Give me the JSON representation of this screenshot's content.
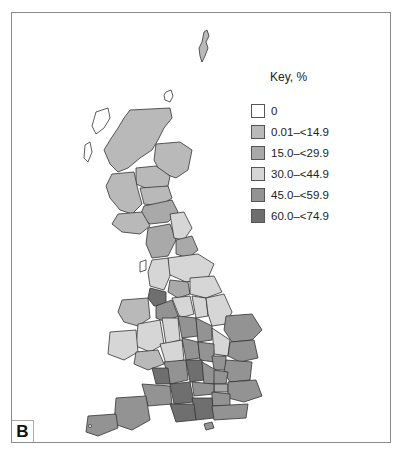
{
  "figure": {
    "panel_label": "B",
    "key_title": "Key, %"
  },
  "key": [
    {
      "label": "0",
      "color": "#ffffff"
    },
    {
      "label": "0.01–<14.9",
      "color": "#b9b9b9"
    },
    {
      "label": "15.0–<29.9",
      "color": "#a9a9a9"
    },
    {
      "label": "30.0–<44.9",
      "color": "#d6d6d6"
    },
    {
      "label": "45.0–<59.9",
      "color": "#939393"
    },
    {
      "label": "60.0–<74.9",
      "color": "#6f6f6f"
    }
  ],
  "map": {
    "subject": "Great Britain choropleth by region",
    "colors": {
      "zero": "#ffffff",
      "c1": "#b9b9b9",
      "c2": "#a9a9a9",
      "c3": "#d6d6d6",
      "c4": "#939393",
      "c5": "#6f6f6f",
      "outline": "#333333"
    }
  }
}
